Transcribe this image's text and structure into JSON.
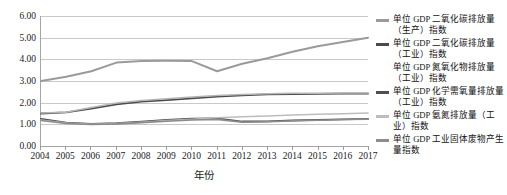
{
  "chart_data": {
    "type": "line",
    "title": "",
    "xlabel": "年份",
    "ylabel": "",
    "grid": true,
    "legend_position": "right",
    "xlim": [
      2004,
      2017
    ],
    "ylim": [
      0.0,
      6.0
    ],
    "x": [
      2004,
      2005,
      2006,
      2007,
      2008,
      2009,
      2010,
      2011,
      2012,
      2013,
      2014,
      2015,
      2016,
      2017
    ],
    "x_tick_labels": [
      "2004",
      "2005",
      "2006",
      "2007",
      "2008",
      "2009",
      "2010",
      "2011",
      "2012",
      "2013",
      "2014",
      "2015",
      "2016",
      "2017"
    ],
    "y_tick_labels": [
      "0.00",
      "1.00",
      "2.00",
      "3.00",
      "4.00",
      "5.00",
      "6.00"
    ],
    "y_ticks": [
      0.0,
      1.0,
      2.0,
      3.0,
      4.0,
      5.0,
      6.0
    ],
    "series": [
      {
        "name": "单位 GDP 二氧化碳排放量（生产）指数",
        "color": "#9a9a9a",
        "width": 2.0,
        "values": [
          3.0,
          3.2,
          3.45,
          3.85,
          3.92,
          3.93,
          3.92,
          3.45,
          3.8,
          4.05,
          4.35,
          4.6,
          4.8,
          5.0
        ]
      },
      {
        "name": "单位 GDP 二氧化碳排放量（工业）指数",
        "color": "#4a4a4a",
        "width": 1.8,
        "values": [
          1.5,
          1.55,
          1.72,
          1.92,
          2.05,
          2.12,
          2.2,
          2.28,
          2.34,
          2.38,
          2.4,
          2.41,
          2.42,
          2.42
        ]
      },
      {
        "name": "单位 GDP 氮氧化物排放量（工业）指数",
        "color": "#b5b5b5",
        "width": 1.5,
        "values": [
          1.52,
          1.56,
          1.78,
          1.98,
          2.1,
          2.18,
          2.26,
          2.33,
          2.38,
          2.41,
          2.43,
          2.44,
          2.45,
          2.45
        ]
      },
      {
        "name": "单位 GDP 化学需氧量排放量（工业）指数",
        "color": "#4f4f4f",
        "width": 1.8,
        "values": [
          1.25,
          1.08,
          1.02,
          1.05,
          1.12,
          1.2,
          1.26,
          1.27,
          1.13,
          1.14,
          1.18,
          1.21,
          1.23,
          1.25
        ]
      },
      {
        "name": "单位 GDP 氨氮排放量（工业）指数",
        "color": "#bdbdbd",
        "width": 1.5,
        "values": [
          1.2,
          1.06,
          1.0,
          1.04,
          1.1,
          1.18,
          1.24,
          1.3,
          1.35,
          1.39,
          1.43,
          1.46,
          1.49,
          1.52
        ]
      },
      {
        "name": "单位 GDP 工业固体废物产生量指数",
        "color": "#8c8c8c",
        "width": 1.6,
        "values": [
          1.18,
          1.04,
          0.99,
          1.02,
          1.08,
          1.14,
          1.2,
          1.23,
          1.1,
          1.12,
          1.16,
          1.19,
          1.22,
          1.24
        ]
      }
    ]
  },
  "legend": {
    "items": [
      {
        "label": "单位 GDP 二氧化碳排放量（生产）指数",
        "swatch": "#9a9a9a",
        "has_swatch": true
      },
      {
        "label": "单位 GDP 二氧化碳排放量（工业）指数",
        "swatch": "#4a4a4a",
        "has_swatch": true
      },
      {
        "label": "单位 GDP 氮氧化物排放量（工业）指数",
        "swatch": "#b5b5b5",
        "has_swatch": false
      },
      {
        "label": "单位 GDP 化学需氧量排放量（工业）指数",
        "swatch": "#4f4f4f",
        "has_swatch": true
      },
      {
        "label": "单位 GDP 氨氮排放量（工业）指数",
        "swatch": "#bdbdbd",
        "has_swatch": true
      },
      {
        "label": "单位 GDP 工业固体废物产生量指数",
        "swatch": "#8c8c8c",
        "has_swatch": true
      }
    ]
  },
  "axes": {
    "x_title": "年份"
  }
}
